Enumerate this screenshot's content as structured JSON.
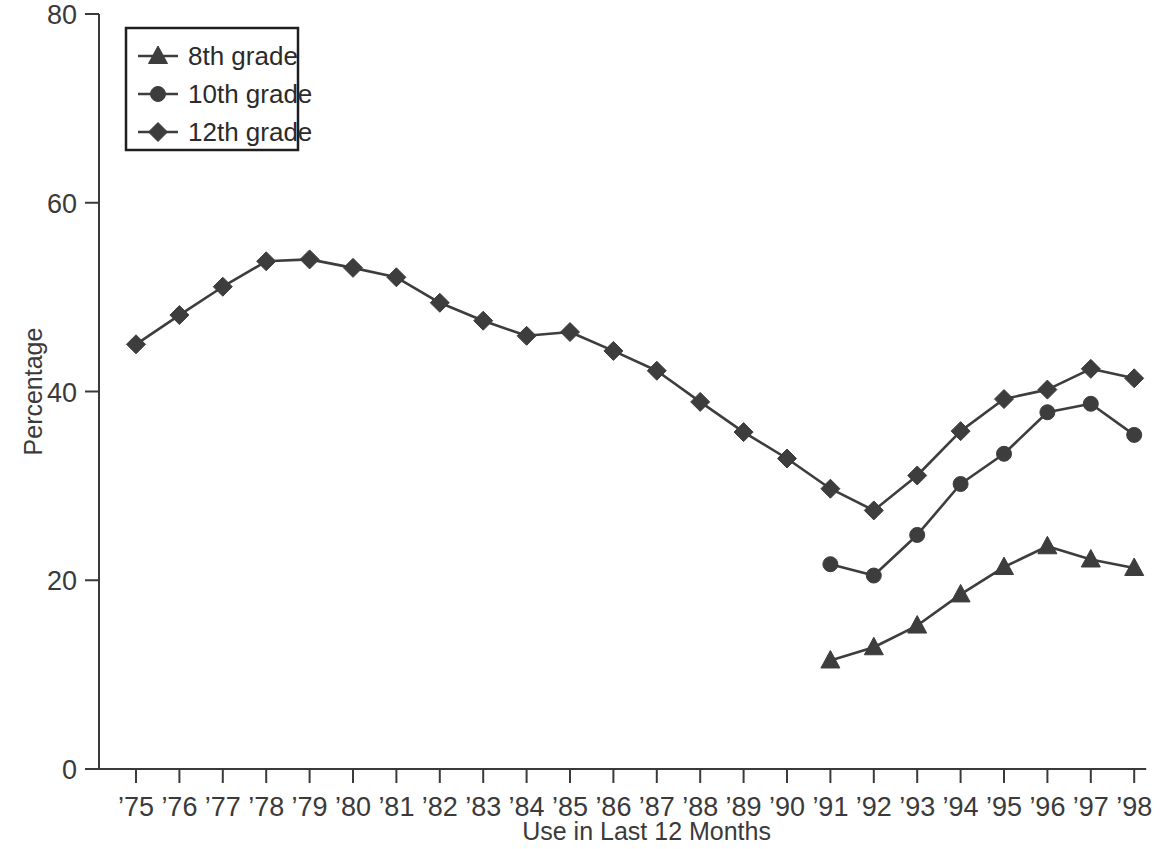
{
  "chart_data": {
    "type": "line",
    "title": "",
    "xlabel": "Use in Last 12 Months",
    "ylabel": "Percentage",
    "ylim": [
      0,
      80
    ],
    "ytick_labels": [
      "0",
      "20",
      "40",
      "60",
      "80"
    ],
    "ytick_values": [
      0,
      20,
      40,
      60,
      80
    ],
    "grid": false,
    "legend_position": "top-left",
    "categories": [
      "'75",
      "'76",
      "'77",
      "'78",
      "'79",
      "'80",
      "'81",
      "'82",
      "'83",
      "'84",
      "'85",
      "'86",
      "'87",
      "'88",
      "'89",
      "'90",
      "'91",
      "'92",
      "'93",
      "'94",
      "'95",
      "'96",
      "'97",
      "'98"
    ],
    "series": [
      {
        "name": "8th grade",
        "marker": "triangle",
        "x": [
          "'91",
          "'92",
          "'93",
          "'94",
          "'95",
          "'96",
          "'97",
          "'98"
        ],
        "values": [
          11.5,
          12.9,
          15.2,
          18.5,
          21.4,
          23.6,
          22.2,
          21.3
        ]
      },
      {
        "name": "10th grade",
        "marker": "circle",
        "x": [
          "'91",
          "'92",
          "'93",
          "'94",
          "'95",
          "'96",
          "'97",
          "'98"
        ],
        "values": [
          21.7,
          20.5,
          24.8,
          30.2,
          33.4,
          37.8,
          38.7,
          35.4
        ]
      },
      {
        "name": "12th grade",
        "marker": "diamond",
        "x": [
          "'75",
          "'76",
          "'77",
          "'78",
          "'79",
          "'80",
          "'81",
          "'82",
          "'83",
          "'84",
          "'85",
          "'86",
          "'87",
          "'88",
          "'89",
          "'90",
          "'91",
          "'92",
          "'93",
          "'94",
          "'95",
          "'96",
          "'97",
          "'98"
        ],
        "values": [
          45.0,
          48.1,
          51.1,
          53.8,
          54.0,
          53.1,
          52.1,
          49.4,
          47.5,
          45.9,
          46.3,
          44.3,
          42.2,
          38.9,
          35.7,
          32.9,
          29.7,
          27.4,
          31.1,
          35.8,
          39.2,
          40.2,
          42.4,
          41.4
        ]
      }
    ]
  },
  "legend": {
    "entries": [
      {
        "label": "8th grade"
      },
      {
        "label": "10th grade"
      },
      {
        "label": "12th grade"
      }
    ]
  },
  "axes": {
    "y_title": "Percentage",
    "x_title": "Use in Last 12 Months"
  }
}
